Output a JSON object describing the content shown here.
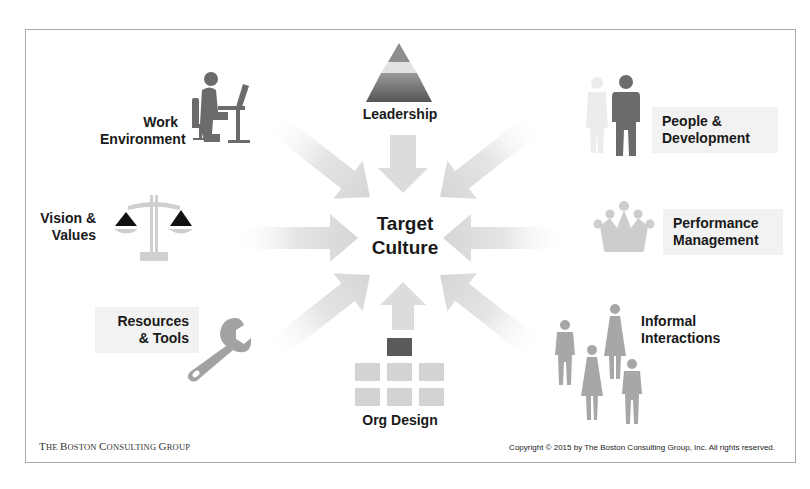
{
  "diagram": {
    "center": {
      "line1": "Target",
      "line2": "Culture"
    },
    "elements": [
      {
        "id": "work-environment",
        "line1": "Work",
        "line2": "Environment",
        "icon": "person-at-desk-icon"
      },
      {
        "id": "leadership",
        "line1": "Leadership",
        "icon": "pyramid-icon"
      },
      {
        "id": "people-development",
        "line1": "People &",
        "line2": "Development",
        "icon": "people-icon"
      },
      {
        "id": "vision-values",
        "line1": "Vision &",
        "line2": "Values",
        "icon": "scales-icon"
      },
      {
        "id": "performance-management",
        "line1": "Performance",
        "line2": "Management",
        "icon": "crown-icon"
      },
      {
        "id": "resources-tools",
        "line1": "Resources",
        "line2": "& Tools",
        "icon": "wrench-icon"
      },
      {
        "id": "org-design",
        "line1": "Org Design",
        "icon": "org-chart-icon"
      },
      {
        "id": "informal-interactions",
        "line1": "Informal",
        "line2": "Interactions",
        "icon": "group-people-icon"
      }
    ],
    "arrows_count": 8
  },
  "footer": {
    "brand_first": "T",
    "brand_rest1": "HE ",
    "brand_b": "B",
    "brand_rest2": "OSTON ",
    "brand_c": "C",
    "brand_rest3": "ONSULTING ",
    "brand_g": "G",
    "brand_rest4": "ROUP",
    "copyright": "Copyright © 2015 by The Boston Consulting Group, Inc. All rights reserved."
  },
  "colors": {
    "icon_dark": "#6b6b6b",
    "icon_light": "#cfcfcf",
    "arrow": "#dedede",
    "label_box": "#f2f2f2",
    "text": "#1a1a1a",
    "frame": "#a9a9a9"
  }
}
